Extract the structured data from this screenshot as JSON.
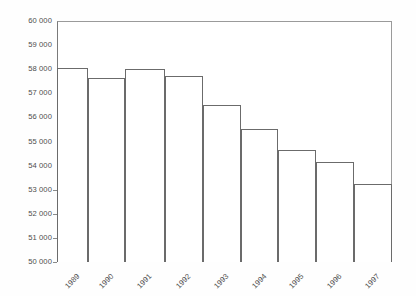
{
  "chart_data": {
    "type": "bar",
    "title": "",
    "subtitle": "",
    "xlabel": "",
    "ylabel": "",
    "categories": [
      "1989",
      "1990",
      "1991",
      "1992",
      "1993",
      "1994",
      "1995",
      "1996",
      "1997"
    ],
    "values": [
      58050,
      57620,
      58020,
      57730,
      56530,
      55520,
      54650,
      54160,
      53250
    ],
    "ylim": [
      50000,
      60000
    ],
    "ytick_step": 1000,
    "ytick_labels": [
      "60 000",
      "59 000",
      "58 000",
      "57 000",
      "56 000",
      "55 000",
      "54 000",
      "53 000",
      "52 000",
      "51 000",
      "50 000"
    ],
    "ytick_values": [
      60000,
      59000,
      58000,
      57000,
      56000,
      55000,
      54000,
      53000,
      52000,
      51000,
      50000
    ],
    "grid": false,
    "legend": null,
    "legend_position": "none",
    "series": [
      {
        "name": "",
        "values": [
          58050,
          57620,
          58020,
          57730,
          56530,
          55520,
          54650,
          54160,
          53250
        ]
      }
    ],
    "colors": {
      "bar_fill": "#ffffff",
      "bar_outline": "#6b6b6b",
      "axis_line": "#8e8e8e",
      "text": "#4d4d4d",
      "background": "#ffffff"
    },
    "bar_geometry": [
      {
        "label": "1989",
        "left_pct": 0.0,
        "width_pct": 9.3
      },
      {
        "label": "1990",
        "left_pct": 9.3,
        "width_pct": 11.0
      },
      {
        "label": "1991",
        "left_pct": 20.3,
        "width_pct": 11.9
      },
      {
        "label": "1992",
        "left_pct": 32.2,
        "width_pct": 11.3
      },
      {
        "label": "1993",
        "left_pct": 43.5,
        "width_pct": 11.3
      },
      {
        "label": "1994",
        "left_pct": 54.8,
        "width_pct": 11.3
      },
      {
        "label": "1995",
        "left_pct": 66.1,
        "width_pct": 11.3
      },
      {
        "label": "1996",
        "left_pct": 77.4,
        "width_pct": 11.3
      },
      {
        "label": "1997",
        "left_pct": 88.7,
        "width_pct": 11.3
      }
    ]
  }
}
